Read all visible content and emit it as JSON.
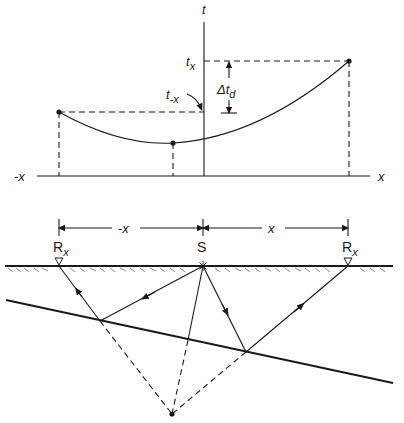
{
  "colors": {
    "ink": "#1a1a1a",
    "background": "#ffffff"
  },
  "plot": {
    "t_axis_label": "t",
    "x_pos_label": "x",
    "x_neg_label": "-x",
    "tx_label": "t",
    "tx_sub": "x",
    "tneg_label": "t",
    "tneg_sub": "-x",
    "delta_label": "Δt",
    "delta_sub": "d"
  },
  "section": {
    "dim_neg_label": "-x",
    "dim_pos_label": "x",
    "source_label": "S",
    "receiver_left_label": "R",
    "receiver_left_sub": "x",
    "receiver_right_label": "R",
    "receiver_right_sub": "x"
  }
}
